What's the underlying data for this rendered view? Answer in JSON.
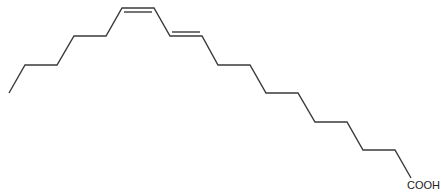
{
  "molecule": {
    "type": "skeletal-formula",
    "description": "Conjugated octadecadienoic acid (cis/trans diene) zig-zag chain",
    "functional_group_label": "COOH",
    "line_color": "#3a3a3a",
    "chain_points": [
      [
        9,
        93
      ],
      [
        25,
        65
      ],
      [
        57,
        65
      ],
      [
        74,
        36
      ],
      [
        106,
        36
      ],
      [
        122,
        8
      ],
      [
        154,
        8
      ],
      [
        170,
        36
      ],
      [
        202,
        36
      ],
      [
        218,
        65
      ],
      [
        250,
        65
      ],
      [
        266,
        93
      ],
      [
        298,
        93
      ],
      [
        315,
        122
      ],
      [
        347,
        122
      ],
      [
        363,
        150
      ],
      [
        395,
        150
      ],
      [
        411,
        178
      ]
    ],
    "double_bonds": [
      {
        "name": "cis-double-bond",
        "from": [
          124,
          12
        ],
        "to": [
          152,
          12
        ]
      },
      {
        "name": "trans-double-bond",
        "from": [
          172,
          32
        ],
        "to": [
          200,
          32
        ]
      }
    ],
    "label_position": [
      407,
      189
    ]
  }
}
